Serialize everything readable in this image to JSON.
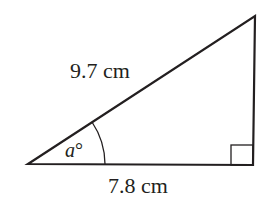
{
  "diagram": {
    "type": "right-triangle",
    "hypotenuse_label": "9.7 cm",
    "base_label": "7.8 cm",
    "angle_label": "a°",
    "angle_var": "a",
    "angle_unit": "°",
    "right_angle_marker": true,
    "colors": {
      "stroke": "#231f20",
      "background": "#ffffff"
    }
  }
}
